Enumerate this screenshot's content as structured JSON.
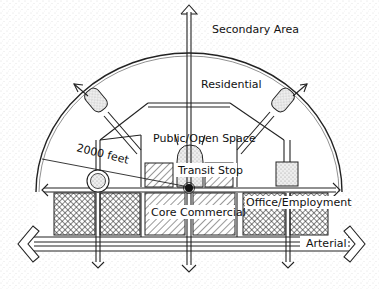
{
  "diagram": {
    "type": "transit-oriented development concept plan",
    "labels": {
      "secondary_area": "Secondary Area",
      "residential": "Residential",
      "public_open_space": "Public/Open Space",
      "transit_stop": "Transit Stop",
      "core_commercial": "Core Commercial",
      "office_employment": "Office/Employment",
      "arterial": "Arterial",
      "radius": "2000 feet"
    },
    "zones": [
      {
        "name": "Secondary Area",
        "fill": "stippled",
        "position": "outside arc"
      },
      {
        "name": "Residential",
        "fill": "white",
        "position": "upper ring"
      },
      {
        "name": "Public/Open Space",
        "fill": "white",
        "position": "center above transit stop"
      },
      {
        "name": "Transit Stop",
        "fill": "stippled",
        "position": "center"
      },
      {
        "name": "Core Commercial",
        "fill": "diagonal hatch",
        "position": "center below transit stop"
      },
      {
        "name": "Office/Employment",
        "fill": "crosshatch",
        "position": "right and left of core"
      }
    ],
    "colors": {
      "line": "#222222",
      "background": "#ffffff",
      "stipple": "#bbbbbb"
    }
  }
}
